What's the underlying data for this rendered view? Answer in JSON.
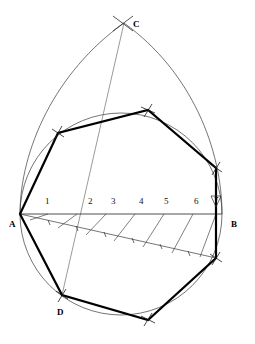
{
  "figure": {
    "colors": {
      "ink": "#000000",
      "thin_line": "#3a3a3a",
      "construction_line": "#555555",
      "background": "#ffffff"
    },
    "stroke_widths": {
      "polygon": 2.2,
      "circle": 0.7,
      "arc": 0.7,
      "construction": 0.6
    }
  },
  "points": [
    {
      "id": "A",
      "label": "A",
      "x": 20,
      "y": 214,
      "label_x": 9,
      "label_y": 224,
      "role": "left-end-of-diameter"
    },
    {
      "id": "B",
      "label": "B",
      "x": 222,
      "y": 214,
      "label_x": 232,
      "label_y": 224,
      "role": "right-end-of-diameter"
    },
    {
      "id": "C",
      "label": "C",
      "x": 124,
      "y": 23,
      "label_x": 133,
      "label_y": 24,
      "role": "arc-intersection-apex"
    },
    {
      "id": "D",
      "label": "D",
      "x": 62,
      "y": 295,
      "label_x": 57,
      "label_y": 312,
      "role": "polygon-vertex-lower-left"
    }
  ],
  "divisions": {
    "axis_y": 214,
    "start_x": 20,
    "end_x": 222,
    "count": 7,
    "labels": [
      {
        "text": "1",
        "x": 45,
        "y": 202
      },
      {
        "text": "2",
        "x": 88,
        "y": 202
      },
      {
        "text": "3",
        "x": 111,
        "y": 202
      },
      {
        "text": "4",
        "x": 139,
        "y": 202
      },
      {
        "text": "5",
        "x": 164,
        "y": 202
      },
      {
        "text": "6",
        "x": 194,
        "y": 202
      },
      {
        "text": "7",
        "x": 215,
        "y": 202
      }
    ]
  },
  "circle": {
    "cx": 121,
    "cy": 214,
    "r": 101
  },
  "heptagon": {
    "vertex_count": 7,
    "vertices": [
      {
        "x": 20,
        "y": 214
      },
      {
        "x": 58,
        "y": 133
      },
      {
        "x": 148,
        "y": 110
      },
      {
        "x": 216,
        "y": 168
      },
      {
        "x": 216,
        "y": 258
      },
      {
        "x": 148,
        "y": 320
      },
      {
        "x": 62,
        "y": 295
      }
    ]
  },
  "construction": {
    "oblique_ray_end": {
      "x": 216,
      "y": 258
    },
    "center_line_from_C": {
      "x1": 124,
      "y1": 23,
      "x2": 62,
      "y2": 295
    },
    "transfer_line_count": 6,
    "tick_marks": true
  }
}
